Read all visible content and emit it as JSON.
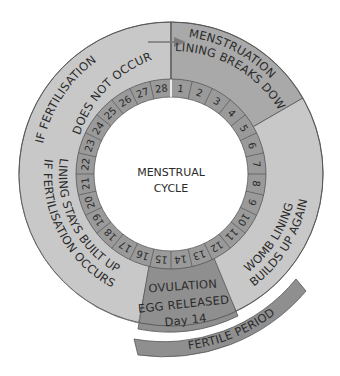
{
  "diagram": {
    "center_line1": "MENSTRUAL",
    "center_line2": "CYCLE",
    "segments": {
      "menstruation": {
        "line1": "MENSTRUATION",
        "line2": "LINING BREAKS DOWN",
        "color": "#a9a9a9"
      },
      "womb_lining": {
        "line1": "WOMB LINING",
        "line2": "BUILDS UP AGAIN",
        "color": "#c8c8c8"
      },
      "ovulation": {
        "line1": "OVULATION",
        "line2": "EGG RELEASED",
        "line3": "Day 14",
        "color": "#8f8f8f"
      },
      "lining_stays": {
        "line1": "LINING STAYS BUILT UP",
        "line2": "IF FERTILISATION OCCURS",
        "color": "#c8c8c8"
      },
      "no_fertilisation": {
        "line1": "IF FERTILISATION",
        "line2": "DOES NOT OCCUR",
        "color": "#c8c8c8"
      }
    },
    "fertile_period": {
      "label": "FERTILE PERIOD",
      "color": "#8f8f8f"
    },
    "days": [
      "1",
      "2",
      "3",
      "4",
      "5",
      "6",
      "7",
      "8",
      "9",
      "10",
      "11",
      "12",
      "13",
      "14",
      "15",
      "16",
      "17",
      "18",
      "19",
      "20",
      "21",
      "22",
      "23",
      "24",
      "25",
      "26",
      "27",
      "28"
    ],
    "day_ring_color": "#9a9a9a",
    "arrow_color": "#7a7a7a"
  }
}
